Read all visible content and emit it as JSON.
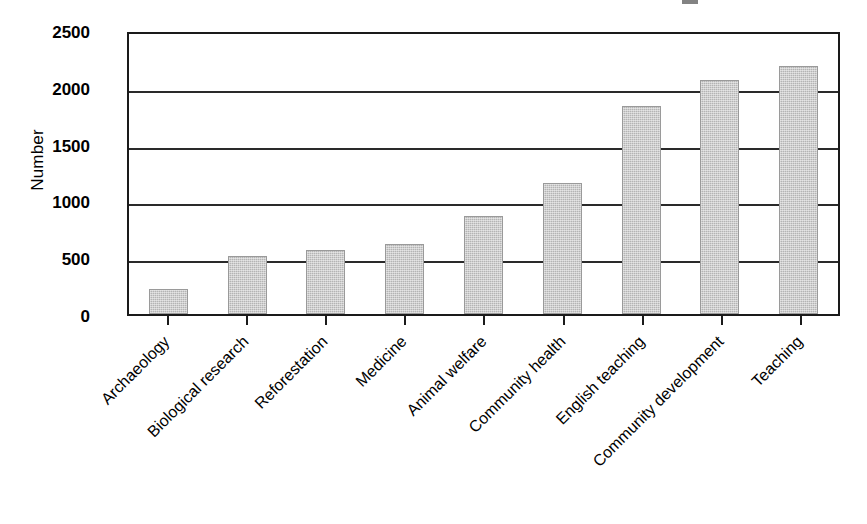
{
  "chart_data": {
    "type": "bar",
    "title": "",
    "xlabel": "",
    "ylabel": "Number",
    "categories": [
      "Archaeology",
      "Biological research",
      "Reforestation",
      "Medicine",
      "Animal welfare",
      "Community health",
      "English teaching",
      "Community development",
      "Teaching"
    ],
    "values": [
      220,
      510,
      560,
      620,
      860,
      1150,
      1830,
      2060,
      2180
    ],
    "ylim": [
      0,
      2500
    ],
    "yticks": [
      2500,
      2000,
      1500,
      1000,
      500,
      0
    ],
    "ytick_labels": [
      "2500",
      "2000",
      "1500",
      "1000",
      "500",
      "0"
    ],
    "grid": true,
    "grid_axis": "y",
    "legend": null,
    "bar_color": "#b4b4b4",
    "axis_color": "#1a1a1a",
    "background": "#ffffff"
  },
  "axes": {
    "y_title": "Number",
    "tick_labels": {
      "t0": "2500",
      "t1": "2000",
      "t2": "1500",
      "t3": "1000",
      "t4": "500",
      "t5": "0"
    }
  }
}
